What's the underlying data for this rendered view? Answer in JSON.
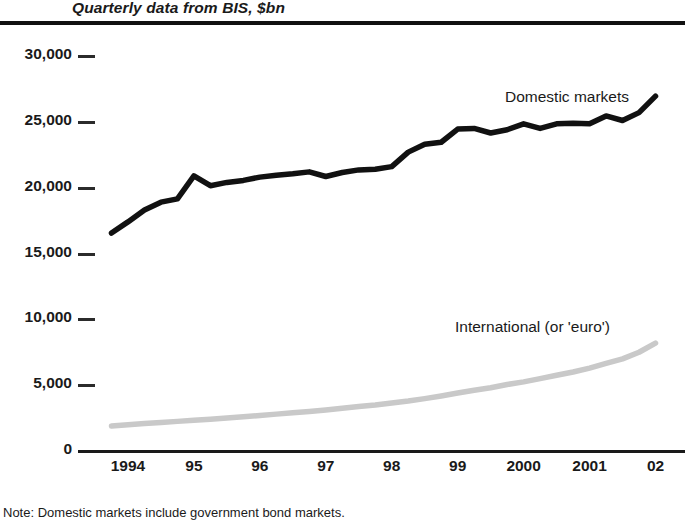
{
  "chart_data": {
    "type": "line",
    "title": "Quarterly data from BIS, $bn",
    "subtitle": "",
    "xlabel": "",
    "ylabel": "",
    "note": "Note: Domestic markets include government bond markets.",
    "grid": false,
    "legend_position": "inline-annotation",
    "ylim": [
      0,
      30000
    ],
    "xlim": [
      1993.5,
      2002.25
    ],
    "yticks": [
      0,
      5000,
      10000,
      15000,
      20000,
      25000,
      30000
    ],
    "ytick_labels": [
      "0",
      "5,000",
      "10,000",
      "15,000",
      "20,000",
      "25,000",
      "30,000"
    ],
    "xticks": [
      1994,
      1995,
      1996,
      1997,
      1998,
      1999,
      2000,
      2001,
      2002
    ],
    "xtick_labels": [
      "1994",
      "95",
      "96",
      "97",
      "98",
      "99",
      "2000",
      "2001",
      "02"
    ],
    "x": [
      1993.75,
      1994.0,
      1994.25,
      1994.5,
      1994.75,
      1995.0,
      1995.25,
      1995.5,
      1995.75,
      1996.0,
      1996.25,
      1996.5,
      1996.75,
      1997.0,
      1997.25,
      1997.5,
      1997.75,
      1998.0,
      1998.25,
      1998.5,
      1998.75,
      1999.0,
      1999.25,
      1999.5,
      1999.75,
      2000.0,
      2000.25,
      2000.5,
      2000.75,
      2001.0,
      2001.25,
      2001.5,
      2001.75,
      2002.0
    ],
    "series": [
      {
        "name": "Domestic markets",
        "color": "#111111",
        "width": 5.5,
        "values": [
          16550,
          17400,
          18300,
          18900,
          19150,
          20900,
          20150,
          20400,
          20550,
          20800,
          20950,
          21050,
          21200,
          20850,
          21150,
          21350,
          21400,
          21600,
          22700,
          23300,
          23450,
          24450,
          24500,
          24150,
          24400,
          24850,
          24500,
          24850,
          24900,
          24850,
          25450,
          25100,
          25700,
          26950
        ]
      },
      {
        "name": "International (or 'euro')",
        "color": "#c9c9c9",
        "width": 5.5,
        "values": [
          1900,
          2000,
          2080,
          2170,
          2250,
          2330,
          2420,
          2500,
          2600,
          2700,
          2800,
          2900,
          3000,
          3120,
          3250,
          3380,
          3500,
          3650,
          3800,
          3980,
          4180,
          4400,
          4620,
          4800,
          5050,
          5250,
          5500,
          5750,
          6000,
          6300,
          6650,
          7000,
          7500,
          8200
        ]
      }
    ],
    "annotations": [
      {
        "text": "Domestic markets",
        "x": 2000.1,
        "y": 27200
      },
      {
        "text": "International (or ‘euro’)",
        "x": 1999.2,
        "y": 10700
      }
    ]
  },
  "axis_geometry": {
    "plot_left": 95,
    "plot_right": 672,
    "y_zero_px": 451,
    "y_top_px": 56
  }
}
